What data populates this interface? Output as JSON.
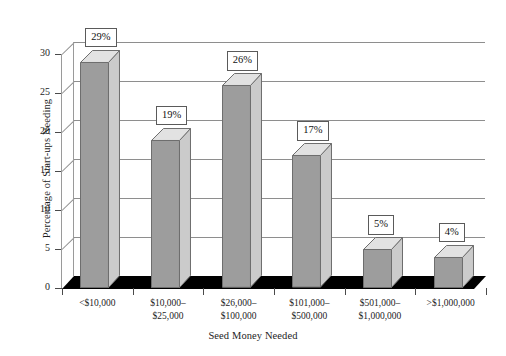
{
  "chart_data": {
    "type": "bar",
    "title": "",
    "subtitle": "",
    "xlabel": "Seed Money Needed",
    "ylabel": "Percentage of Start-ups Needing",
    "categories": [
      "<$10,000",
      "$10,000–$25,000",
      "$26,000–$100,000",
      "$101,000–$500,000",
      "$501,000–$1,000,000",
      ">$1,000,000"
    ],
    "category_lines": [
      [
        "<$10,000",
        ""
      ],
      [
        "$10,000–",
        "$25,000"
      ],
      [
        "$26,000–",
        "$100,000"
      ],
      [
        "$101,000–",
        "$500,000"
      ],
      [
        "$501,000–",
        "$1,000,000"
      ],
      [
        ">$1,000,000",
        ""
      ]
    ],
    "values": [
      29,
      19,
      26,
      17,
      5,
      4
    ],
    "data_labels": [
      "29%",
      "19%",
      "26%",
      "17%",
      "5%",
      "4%"
    ],
    "ylim": [
      0,
      30
    ],
    "yticks": [
      0,
      5,
      10,
      15,
      20,
      25,
      30
    ],
    "ytick_labels": [
      "0",
      "5",
      "10",
      "15",
      "20",
      "25",
      "30"
    ],
    "grid": true,
    "grid_axis": "y",
    "legend": false,
    "legend_position": "none",
    "style": "3d-column",
    "colors": {
      "bar_front": "#9d9d9d",
      "bar_side": "#cbcbcb",
      "bar_top": "#e2e2e2",
      "bar_edge": "#6d6d6d",
      "gridline": "#8e8e8e",
      "floor": "#000000",
      "text": "#1d1d1d",
      "background": "#ffffff"
    }
  }
}
